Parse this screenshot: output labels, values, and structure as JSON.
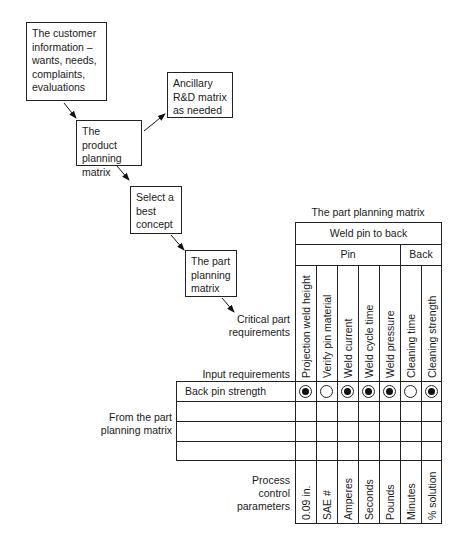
{
  "flow": {
    "customer_box": "The customer information – wants, needs, complaints, evaluations",
    "product_matrix_box": "The product planning matrix",
    "ancillary_box": "Ancillary R&D matrix as needed",
    "concept_box": "Select a best concept",
    "part_matrix_box": "The part planning matrix"
  },
  "matrix": {
    "title": "The part planning matrix",
    "top_header": "Weld pin to back",
    "groups": [
      {
        "label": "Pin",
        "span": 5
      },
      {
        "label": "Back",
        "span": 2
      }
    ],
    "critical_part_label": "Critical part requirements",
    "input_requirements_label": "Input requirements",
    "from_label": "From the part planning matrix",
    "columns": [
      "Projection weld height",
      "Verify pin material",
      "Weld current",
      "Weld cycle time",
      "Weld pressure",
      "Cleaning time",
      "Cleaning strength"
    ],
    "rows": [
      {
        "label": "Back pin strength",
        "relationships": [
          "strong",
          "weak",
          "strong",
          "strong",
          "strong",
          "weak",
          "strong"
        ]
      },
      {
        "label": "",
        "relationships": [
          "",
          "",
          "",
          "",
          "",
          "",
          ""
        ]
      },
      {
        "label": "",
        "relationships": [
          "",
          "",
          "",
          "",
          "",
          "",
          ""
        ]
      },
      {
        "label": "",
        "relationships": [
          "",
          "",
          "",
          "",
          "",
          "",
          ""
        ]
      }
    ],
    "process_control_label": "Process control parameters",
    "process_parameters": [
      "0.09 in.",
      "SAE #",
      "Amperes",
      "Seconds",
      "Pounds",
      "Minutes",
      "% solution"
    ],
    "legend": {
      "strong": "filled circle inside ring",
      "weak": "open circle"
    }
  }
}
